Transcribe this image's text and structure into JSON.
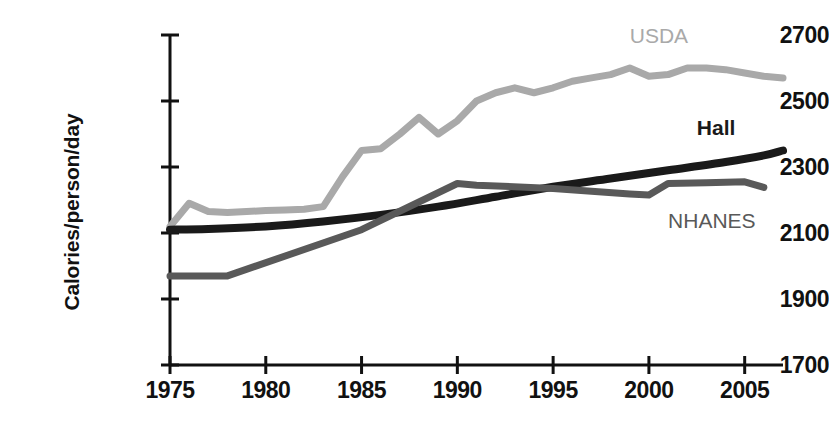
{
  "chart_data": {
    "type": "line",
    "title": "",
    "xlabel": "",
    "ylabel": "Calories/person/day",
    "xlim": [
      1975,
      2007
    ],
    "ylim": [
      1700,
      2700
    ],
    "xticks": [
      1975,
      1980,
      1985,
      1990,
      1995,
      2000,
      2005
    ],
    "yticks": [
      1700,
      1900,
      2100,
      2300,
      2500,
      2700
    ],
    "grid": false,
    "legend_position": "inline-annotations",
    "series": [
      {
        "name": "USDA",
        "color": "#a9a9a9",
        "label_x": 1999.0,
        "label_y": 2700,
        "x": [
          1975,
          1976,
          1977,
          1978,
          1979,
          1980,
          1981,
          1982,
          1983,
          1984,
          1985,
          1986,
          1987,
          1988,
          1989,
          1990,
          1991,
          1992,
          1993,
          1994,
          1995,
          1996,
          1997,
          1998,
          1999,
          2000,
          2001,
          2002,
          2003,
          2004,
          2005,
          2006,
          2007
        ],
        "y": [
          2120,
          2190,
          2165,
          2162,
          2165,
          2168,
          2170,
          2172,
          2180,
          2270,
          2350,
          2355,
          2400,
          2450,
          2400,
          2440,
          2500,
          2525,
          2540,
          2525,
          2540,
          2560,
          2570,
          2580,
          2600,
          2575,
          2580,
          2600,
          2600,
          2595,
          2585,
          2575,
          2570
        ]
      },
      {
        "name": "Hall",
        "color": "#1a1a1a",
        "label_x": 2002.5,
        "label_y": 2420,
        "x": [
          1975,
          1977,
          1980,
          1983,
          1986,
          1989,
          1992,
          1995,
          1998,
          2001,
          2004,
          2006,
          2007
        ],
        "y": [
          2110,
          2112,
          2120,
          2135,
          2155,
          2180,
          2210,
          2240,
          2265,
          2290,
          2315,
          2335,
          2350
        ]
      },
      {
        "name": "NHANES",
        "color": "#595959",
        "label_x": 2001.0,
        "label_y": 2140,
        "x": [
          1975,
          1978,
          1985,
          1990,
          1991,
          1995,
          1999,
          2000,
          2001,
          2003,
          2005,
          2006
        ],
        "y": [
          1970,
          1970,
          2110,
          2250,
          2245,
          2235,
          2218,
          2215,
          2250,
          2252,
          2255,
          2238
        ]
      }
    ]
  }
}
